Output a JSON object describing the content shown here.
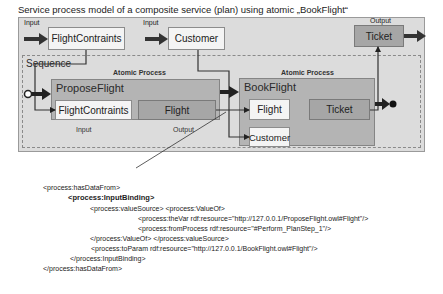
{
  "title": "Service process model of a composite service (plan) using atomic „BookFlight“",
  "plan": {
    "inputs": [
      {
        "label": "Input",
        "param": "FlightContraints"
      },
      {
        "label": "Input",
        "param": "Customer"
      }
    ],
    "output": {
      "label": "Output",
      "param": "Ticket"
    }
  },
  "sequence": {
    "label": "Sequence",
    "processes": [
      {
        "type_label": "Atomic Process",
        "name": "ProposeFlight",
        "input_param": "FlightContraints",
        "output_param": "Flight",
        "input_label": "Input",
        "output_label": "Output"
      },
      {
        "type_label": "Atomic Process",
        "name": "BookFlight",
        "input_params": [
          "Flight",
          "Customer"
        ],
        "output_param": "Ticket"
      }
    ]
  },
  "code": {
    "lines": [
      "<process:hasDataFrom>",
      "<process:InputBinding>",
      "<process:valueSource> <process:ValueOf>",
      "<process:theVar rdf:resource=\"http://127.0.0.1/ProposeFlight.owl#Flight\"/>",
      "<process:fromProcess rdf:resource=\"#Perform_PlanStep_1\"/>",
      "</process:ValueOf> </process:valueSource>",
      "<process:toParam rdf:resource=\"http://127.0.0.1/BookFlight.owl#Flight\"/>",
      "</process:InputBinding>",
      "</process:hasDataFrom>"
    ]
  },
  "icons": {
    "arrow": "thick-right-arrow",
    "start": "open-circle",
    "end": "filled-circle"
  }
}
